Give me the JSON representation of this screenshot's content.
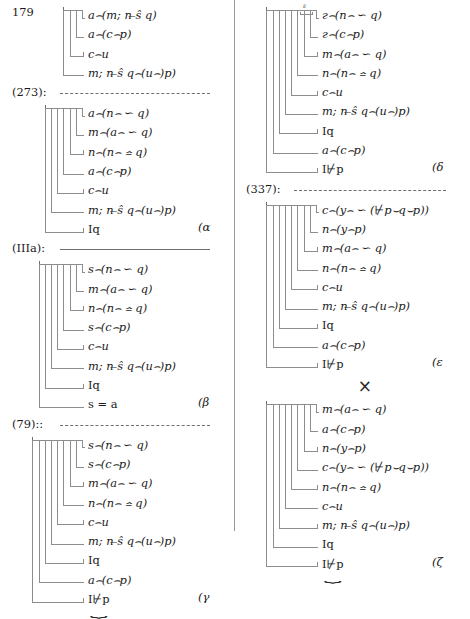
{
  "document": {
    "title": "Proof tree fragments page",
    "columns": 2
  },
  "symbols": {
    "cap": "⌢",
    "similar": "∽",
    "similar_eq": "≏",
    "underset_s": "̶",
    "nonturnstile": "⊬",
    "times": "×",
    "brace": "⏟"
  },
  "left_column": {
    "blocks": [
      {
        "name": "block-179",
        "line_number": "179",
        "rows": [
          "a⌢(m; n ̶ŝ q)",
          "a⌢(c⌢p)",
          "c⌢u",
          "m; n ̶ŝ q⌢(u⌢)p)"
        ]
      },
      {
        "name": "block-alpha",
        "separator": {
          "label": "(273):",
          "style": "dashed"
        },
        "rows": [
          "a⌢(n⌢ ∽ q)",
          "m⌢(a⌢ ∽ q)",
          "n⌢(n⌢ ≏ q)",
          "a⌢(c⌢p)",
          "c⌢u",
          "m; n ̶ŝ q⌢(u⌢)p)",
          "Iq"
        ],
        "greek": "(α"
      },
      {
        "name": "block-beta",
        "separator": {
          "label": "(IIIa):",
          "style": "solid"
        },
        "rows": [
          "s⌢(n⌢ ∽ q)",
          "m⌢(a⌢ ∽ q)",
          "n⌢(n⌢ ≏ q)",
          "s⌢(c⌢p)",
          "c⌢u",
          "m; n ̶ŝ q⌢(u⌢)p)",
          "Iq",
          "s = a"
        ],
        "greek": "(β"
      },
      {
        "name": "block-gamma",
        "separator": {
          "label": "(79)::",
          "style": "dashed"
        },
        "rows": [
          "s⌢(n⌢ ∽ q)",
          "s⌢(c⌢p)",
          "m⌢(a⌢ ∽ q)",
          "n⌢(n⌢ ≏ q)",
          "c⌢u",
          "m; n ̶ŝ q⌢(u⌢)p)",
          "Iq",
          "a⌢(c⌢p)",
          "I⊬p"
        ],
        "greek": "(γ",
        "brace": true
      }
    ]
  },
  "right_column": {
    "blocks": [
      {
        "name": "block-delta",
        "mini_label": "ᴱ",
        "rows": [
          "г⌢(n⌢ ∽ q)",
          "г⌢(c⌢p)",
          "m⌢(a⌢ ∽ q)",
          "n⌢(n⌢ ≏ q)",
          "c⌢u",
          "m; n ̶ŝ q⌢(u⌢)p)",
          "Iq",
          "a⌢(c⌢p)",
          "I⊬p"
        ],
        "greek": "(δ"
      },
      {
        "name": "block-epsilon",
        "separator": {
          "label": "(337):",
          "style": "dashed"
        },
        "rows": [
          "c⌢(y⌢ ∽ (⊬p⌣q⌣p))",
          "n⌢(y⌢p)",
          "m⌢(a⌢ ∽ q)",
          "n⌢(n⌢ ≏ q)",
          "c⌢u",
          "m; n ̶ŝ q⌢(u⌢)p)",
          "Iq",
          "a⌢(c⌢p)",
          "I⊬p"
        ],
        "greek": "(ε"
      },
      {
        "name": "block-zeta",
        "separator": {
          "label": "×",
          "style": "times"
        },
        "rows": [
          "m⌢(a⌢ ∽ q)",
          "a⌢(c⌢p)",
          "n⌢(y⌢p)",
          "c⌢(y⌢ ∽ (⊬p⌣q⌣p))",
          "n⌢(n⌢ ≏ q)",
          "c⌢u",
          "m; n ̶ŝ q⌢(u⌢)p)",
          "Iq",
          "I⊬p"
        ],
        "greek": "(ζ",
        "brace": true
      }
    ]
  }
}
